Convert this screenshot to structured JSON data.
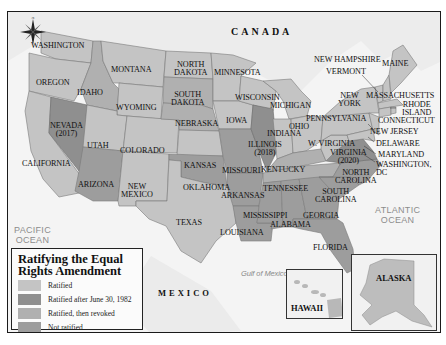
{
  "map": {
    "title": "Ratifying the Equal Rights Amendment",
    "colors": {
      "ratified": "#c4c4c4",
      "ratified_after_1982": "#8f8f8f",
      "ratified_then_revoked": "#b0b0b0",
      "not_ratified": "#9d9d9d",
      "land_foreign": "#eaeaea",
      "water": "#f7f7f7"
    },
    "countries": {
      "canada": "CANADA",
      "mexico": "MEXICO"
    },
    "water_bodies": {
      "pacific": [
        "PACIFIC",
        "OCEAN"
      ],
      "atlantic": [
        "ATLANTIC",
        "OCEAN"
      ],
      "gulf": "Gulf of Mexico"
    },
    "states": {
      "washington": "WASHINGTON",
      "oregon": "OREGON",
      "california": "CALIFORNIA",
      "nevada": [
        "NEVADA",
        "(2017)"
      ],
      "idaho": "IDAHO",
      "montana": "MONTANA",
      "wyoming": "WYOMING",
      "utah": "UTAH",
      "arizona": "ARIZONA",
      "colorado": "COLORADO",
      "new_mexico": [
        "NEW",
        "MEXICO"
      ],
      "north_dakota": [
        "NORTH",
        "DAKOTA"
      ],
      "south_dakota": [
        "SOUTH",
        "DAKOTA"
      ],
      "nebraska": "NEBRASKA",
      "kansas": "KANSAS",
      "oklahoma": "OKLAHOMA",
      "texas": "TEXAS",
      "minnesota": "MINNESOTA",
      "iowa": "IOWA",
      "missouri": "MISSOURI",
      "arkansas": "ARKANSAS",
      "louisiana": "LOUISIANA",
      "wisconsin": "WISCONSIN",
      "illinois": [
        "ILLINOIS",
        "(2018)"
      ],
      "michigan": "MICHIGAN",
      "indiana": "INDIANA",
      "ohio": "OHIO",
      "kentucky": "KENTUCKY",
      "tennessee": "TENNESSEE",
      "mississippi": "MISSISSIPPI",
      "alabama": "ALABAMA",
      "georgia": "GEORGIA",
      "florida": "FLORIDA",
      "south_carolina": [
        "SOUTH",
        "CAROLINA"
      ],
      "north_carolina": [
        "NORTH",
        "CAROLINA"
      ],
      "virginia": [
        "VIRGINIA",
        "(2020)"
      ],
      "west_virginia": "W. VIRGINIA",
      "pennsylvania": "PENNSYLVANIA",
      "new_york": [
        "NEW",
        "YORK"
      ],
      "vermont": "VERMONT",
      "new_hampshire": "NEW HAMPSHIRE",
      "maine": "MAINE",
      "massachusetts": "MASSACHUSETTS",
      "rhode_island": [
        "RHODE",
        "ISLAND"
      ],
      "connecticut": "CONNECTICUT",
      "new_jersey": "NEW JERSEY",
      "delaware": "DELAWARE",
      "maryland": "MARYLAND",
      "washington_dc": [
        "WASHINGTON,",
        "DC"
      ],
      "alaska": "ALASKA",
      "hawaii": "HAWAII"
    },
    "legend": {
      "title_line1": "Ratifying the Equal",
      "title_line2": "Rights Amendment",
      "items": [
        {
          "label": "Ratified",
          "color": "#c4c4c4"
        },
        {
          "label": "Ratified after June 30, 1982",
          "color": "#8f8f8f"
        },
        {
          "label": "Ratified, then revoked",
          "color": "#b0b0b0"
        },
        {
          "label": "Not ratified",
          "color": "#9d9d9d"
        }
      ]
    },
    "scale_bar": {
      "zero_top": "0",
      "zero_bottom": "0",
      "miles": "500 Miles",
      "kilometers": "500 Kilometers"
    },
    "compass": {
      "n": "N",
      "s": "S",
      "e": "E",
      "w": "W"
    }
  }
}
